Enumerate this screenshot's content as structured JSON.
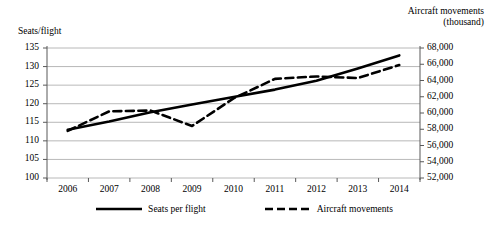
{
  "chart_data": {
    "type": "line",
    "title": "",
    "xlabel": "",
    "ylabel": "Seats/flight",
    "y2label": "Aircraft movements (thousand)",
    "grid": true,
    "legend_position": "bottom",
    "categories": [
      "2006",
      "2007",
      "2008",
      "2009",
      "2010",
      "2011",
      "2012",
      "2013",
      "2014"
    ],
    "ylim": [
      100,
      135
    ],
    "y2lim": [
      52000,
      68000
    ],
    "yticks": [
      "100",
      "105",
      "110",
      "115",
      "120",
      "125",
      "130",
      "135"
    ],
    "y2ticks": [
      "52,000",
      "54,000",
      "56,000",
      "58,000",
      "60,000",
      "62,000",
      "64,000",
      "66,000",
      "68,000"
    ],
    "series": [
      {
        "name": "Seats per flight",
        "axis": "left",
        "style": "solid",
        "color": "#000000",
        "values": [
          113.0,
          115.2,
          117.7,
          119.8,
          121.8,
          123.8,
          126.2,
          129.5,
          133.0
        ]
      },
      {
        "name": "Aircraft movements",
        "axis": "right",
        "style": "dashed",
        "color": "#000000",
        "values": [
          57800,
          60200,
          60300,
          58400,
          61800,
          64200,
          64500,
          64300,
          65900
        ]
      }
    ]
  },
  "axes": {
    "left_title": "Seats/flight",
    "right_title_line1": "Aircraft movements",
    "right_title_line2": "(thousand)"
  },
  "legend": {
    "items": [
      {
        "label": "Seats per flight",
        "style": "solid"
      },
      {
        "label": "Aircraft movements",
        "style": "dashed"
      }
    ]
  },
  "colors": {
    "line": "#000000",
    "grid": "#a6a6a6",
    "axis": "#595959",
    "background": "#ffffff"
  }
}
